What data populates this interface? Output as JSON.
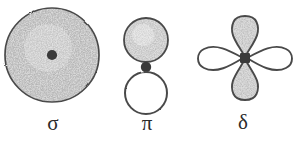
{
  "figure": {
    "background_color": "#ffffff",
    "ink_color": "#3a3a3a",
    "stipple_color": "#8a8a8a",
    "width": 298,
    "height": 142
  },
  "orbitals": [
    {
      "id": "sigma",
      "label": "σ",
      "name": "sigma",
      "description": "Single large stippled circle with dark nucleus dot at center",
      "lobes": 1,
      "shading": "stippled",
      "nucleus": "round-dot",
      "center_x": 52,
      "center_y": 55,
      "radius": 48
    },
    {
      "id": "pi",
      "label": "π",
      "name": "pi",
      "description": "Stippled circle above and open white circle below, separated by a dark nucleus dot",
      "lobes": 2,
      "shading": "top-stippled-bottom-open",
      "nucleus": "round-dot",
      "center_x": 146,
      "center_y": 62,
      "radius": 22
    },
    {
      "id": "delta",
      "label": "δ",
      "name": "delta",
      "description": "Four teardrop lobes in a cloverleaf; vertical lobes stippled, horizontal lobes open, dark square nucleus at center",
      "lobes": 4,
      "shading": "vertical-stippled-horizontal-open",
      "nucleus": "square-dot",
      "center_x": 245,
      "center_y": 58,
      "lobe_length": 44,
      "lobe_width": 26
    }
  ]
}
